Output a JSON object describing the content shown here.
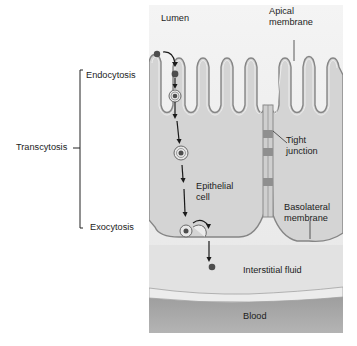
{
  "diagram": {
    "regions": {
      "lumen": "Lumen",
      "interstitial_fluid": "Interstitial fluid",
      "blood": "Blood",
      "epithelial_cell": "Epithelial\ncell"
    },
    "membranes": {
      "apical": "Apical\nmembrane",
      "basolateral": "Basolateral\nmembrane",
      "tight_junction": "Tight\njunction"
    },
    "process": {
      "group_label": "Transcytosis",
      "steps": [
        {
          "label": "Endocytosis"
        },
        {
          "label": "Exocytosis"
        }
      ]
    },
    "colors": {
      "lumen_bg": "#ededed",
      "cell_fill": "#d6d6d6",
      "membrane": "#8a8a8a",
      "interstitial_bg": "#e4e4e4",
      "blood": "#a8a8a8",
      "molecule": "#555555"
    }
  }
}
